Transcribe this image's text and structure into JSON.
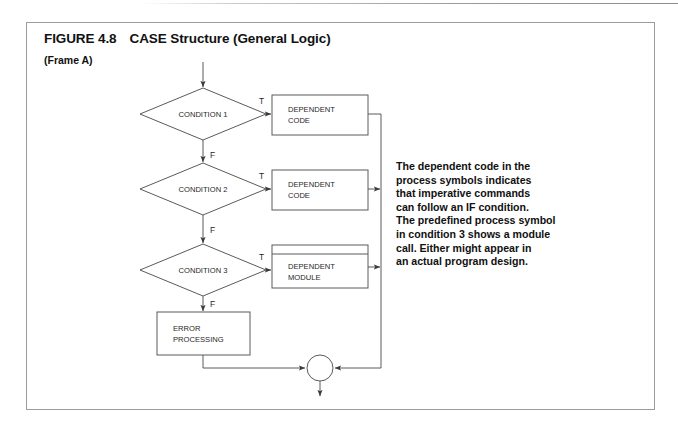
{
  "figure": {
    "number": "FIGURE 4.8",
    "title": "CASE Structure (General Logic)",
    "frame_label": "(Frame A)"
  },
  "note": {
    "text": "The dependent code in the\nprocess symbols indicates\nthat imperative commands\ncan follow an IF condition.\nThe predefined process symbol\nin condition 3 shows a module\ncall. Either might appear in\nan actual program design."
  },
  "flowchart": {
    "decisions": [
      {
        "id": "condition-1",
        "label": "CONDITION 1",
        "true_label": "T",
        "false_label": "F"
      },
      {
        "id": "condition-2",
        "label": "CONDITION 2",
        "true_label": "T",
        "false_label": "F"
      },
      {
        "id": "condition-3",
        "label": "CONDITION 3",
        "true_label": "T",
        "false_label": "F"
      }
    ],
    "processes": [
      {
        "id": "dependent-code-1",
        "line1": "DEPENDENT",
        "line2": "CODE",
        "symbol": "process"
      },
      {
        "id": "dependent-code-2",
        "line1": "DEPENDENT",
        "line2": "CODE",
        "symbol": "process"
      },
      {
        "id": "dependent-module",
        "line1": "DEPENDENT",
        "line2": "MODULE",
        "symbol": "predefined-process"
      },
      {
        "id": "error-processing",
        "line1": "ERROR",
        "line2": "PROCESSING",
        "symbol": "process"
      }
    ],
    "connector": {
      "id": "merge-connector",
      "symbol": "circle"
    }
  },
  "colors": {
    "frame_border": "#9b9b9b",
    "shape_stroke": "#5a5a5a",
    "text": "#111111",
    "background": "#ffffff"
  }
}
